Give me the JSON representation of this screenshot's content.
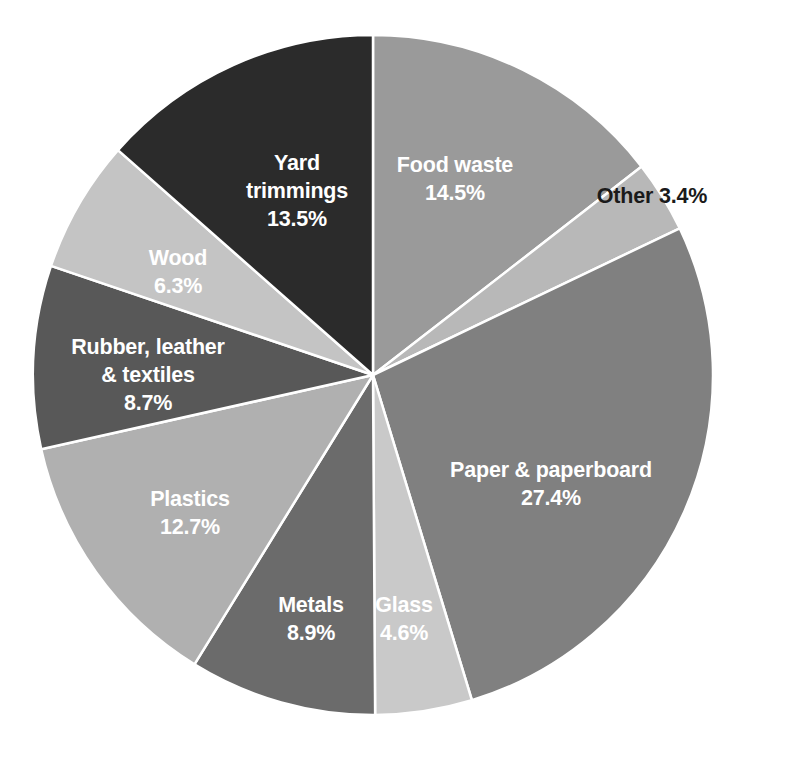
{
  "chart_data": {
    "type": "pie",
    "title": "",
    "subtitle": "",
    "xlabel": "",
    "ylabel": "",
    "units": "percent",
    "total": 100.0,
    "start_angle_deg": 0,
    "direction": "clockwise",
    "legend_position": "none",
    "labels_inside_slices": true,
    "grid": false,
    "background_color": "#ffffff",
    "slice_border_color": "#ffffff",
    "slice_border_width": 2.5,
    "categories": [
      "Food waste",
      "Other",
      "Paper & paperboard",
      "Glass",
      "Metals",
      "Plastics",
      "Rubber, leather & textiles",
      "Wood",
      "Yard trimmings"
    ],
    "values": [
      14.5,
      3.4,
      27.4,
      4.6,
      8.9,
      12.7,
      8.7,
      6.3,
      13.5
    ],
    "slices": [
      {
        "name": "Food waste",
        "value": 14.5,
        "value_label": "14.5%",
        "color": "#9a9a9a",
        "label_lines": [
          "Food waste",
          "14.5%"
        ],
        "label_color": "#ffffff",
        "label_placement": "inside",
        "label_x": 455,
        "label_y": 172,
        "line_height": 28
      },
      {
        "name": "Other",
        "value": 3.4,
        "value_label": "3.4%",
        "color": "#b8b8b8",
        "label_lines": [
          "Other 3.4%"
        ],
        "label_color": "#1a1a1a",
        "label_placement": "outside",
        "label_x": 652,
        "label_y": 203,
        "line_height": 28
      },
      {
        "name": "Paper & paperboard",
        "value": 27.4,
        "value_label": "27.4%",
        "color": "#808080",
        "label_lines": [
          "Paper & paperboard",
          "27.4%"
        ],
        "label_color": "#ffffff",
        "label_placement": "inside",
        "label_x": 551,
        "label_y": 477,
        "line_height": 28
      },
      {
        "name": "Glass",
        "value": 4.6,
        "value_label": "4.6%",
        "color": "#c9c9c9",
        "label_lines": [
          "Glass",
          "4.6%"
        ],
        "label_color": "#ffffff",
        "label_placement": "inside",
        "label_x": 404,
        "label_y": 612,
        "line_height": 28
      },
      {
        "name": "Metals",
        "value": 8.9,
        "value_label": "8.9%",
        "color": "#6b6b6b",
        "label_lines": [
          "Metals",
          "8.9%"
        ],
        "label_color": "#ffffff",
        "label_placement": "inside",
        "label_x": 311,
        "label_y": 612,
        "line_height": 28
      },
      {
        "name": "Plastics",
        "value": 12.7,
        "value_label": "12.7%",
        "color": "#b0b0b0",
        "label_lines": [
          "Plastics",
          "12.7%"
        ],
        "label_color": "#ffffff",
        "label_placement": "inside",
        "label_x": 190,
        "label_y": 506,
        "line_height": 28
      },
      {
        "name": "Rubber, leather & textiles",
        "value": 8.7,
        "value_label": "8.7%",
        "color": "#585858",
        "label_lines": [
          "Rubber, leather",
          "& textiles",
          "8.7%"
        ],
        "label_color": "#ffffff",
        "label_placement": "inside",
        "label_x": 148,
        "label_y": 354,
        "line_height": 28
      },
      {
        "name": "Wood",
        "value": 6.3,
        "value_label": "6.3%",
        "color": "#c4c4c4",
        "label_lines": [
          "Wood",
          "6.3%"
        ],
        "label_color": "#ffffff",
        "label_placement": "inside",
        "label_x": 178,
        "label_y": 265,
        "line_height": 28
      },
      {
        "name": "Yard trimmings",
        "value": 13.5,
        "value_label": "13.5%",
        "color": "#2b2b2b",
        "label_lines": [
          "Yard",
          "trimmings",
          "13.5%"
        ],
        "label_color": "#ffffff",
        "label_placement": "inside",
        "label_x": 297,
        "label_y": 170,
        "line_height": 28
      }
    ],
    "geometry": {
      "center_x": 373,
      "center_y": 375,
      "radius": 340
    }
  }
}
